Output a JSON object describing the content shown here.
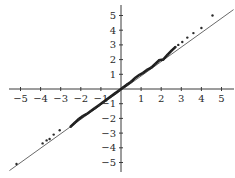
{
  "chart_data": {
    "type": "scatter",
    "subtype": "qq-plot",
    "title": "",
    "xlabel": "",
    "ylabel": "",
    "xlim": [
      -5.6,
      5.6
    ],
    "ylim": [
      -5.6,
      5.6
    ],
    "grid": false,
    "legend": null,
    "x_ticks": [
      -5,
      -4,
      -3,
      -2,
      -1,
      1,
      2,
      3,
      4,
      5
    ],
    "y_ticks": [
      5,
      4,
      3,
      2,
      1,
      -1,
      -2,
      -3,
      -4,
      -5
    ],
    "x_tick_labels": [
      "−5",
      "−4",
      "−3",
      "−2",
      "−1",
      "1",
      "2",
      "3",
      "4",
      "5"
    ],
    "y_tick_labels": [
      "5",
      "4",
      "3",
      "2",
      "1",
      "−1",
      "−2",
      "−3",
      "−4",
      "−5"
    ],
    "reference_line": {
      "x": [
        -5.55,
        5.6
      ],
      "y": [
        -5.55,
        5.4
      ],
      "label": "y = x"
    },
    "series": [
      {
        "name": "sample quantiles",
        "points": [
          [
            -5.2,
            -5.1
          ],
          [
            -3.9,
            -3.7
          ],
          [
            -3.7,
            -3.5
          ],
          [
            -3.55,
            -3.4
          ],
          [
            -3.35,
            -3.1
          ],
          [
            -3.05,
            -2.8
          ],
          [
            -2.5,
            -2.55
          ],
          [
            -2.3,
            -2.3
          ],
          [
            -2.1,
            -2.05
          ],
          [
            -1.9,
            -1.85
          ],
          [
            -1.7,
            -1.7
          ],
          [
            -1.5,
            -1.5
          ],
          [
            -1.3,
            -1.3
          ],
          [
            -1.1,
            -1.1
          ],
          [
            -0.9,
            -0.9
          ],
          [
            -0.7,
            -0.7
          ],
          [
            -0.5,
            -0.5
          ],
          [
            -0.3,
            -0.3
          ],
          [
            -0.1,
            -0.1
          ],
          [
            0.1,
            0.1
          ],
          [
            0.3,
            0.3
          ],
          [
            0.5,
            0.5
          ],
          [
            0.7,
            0.75
          ],
          [
            0.9,
            0.95
          ],
          [
            1.1,
            1.1
          ],
          [
            1.3,
            1.3
          ],
          [
            1.5,
            1.45
          ],
          [
            1.7,
            1.7
          ],
          [
            1.9,
            1.95
          ],
          [
            2.1,
            2.0
          ],
          [
            2.3,
            2.3
          ],
          [
            2.5,
            2.6
          ],
          [
            2.7,
            2.85
          ],
          [
            2.85,
            3.0
          ],
          [
            3.05,
            3.2
          ],
          [
            3.3,
            3.5
          ],
          [
            3.6,
            3.8
          ],
          [
            4.0,
            4.15
          ],
          [
            4.55,
            5.0
          ]
        ]
      }
    ],
    "dense_band": {
      "from": [
        -2.6,
        -2.6
      ],
      "to": [
        2.7,
        2.9
      ]
    }
  }
}
